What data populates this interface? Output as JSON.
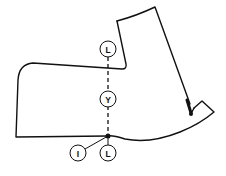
{
  "diagram": {
    "labels": {
      "top": "L",
      "middle": "Y",
      "bottom_left": "I",
      "bottom_right": "L"
    },
    "colors": {
      "line": "#111111",
      "background": "#ffffff"
    }
  }
}
